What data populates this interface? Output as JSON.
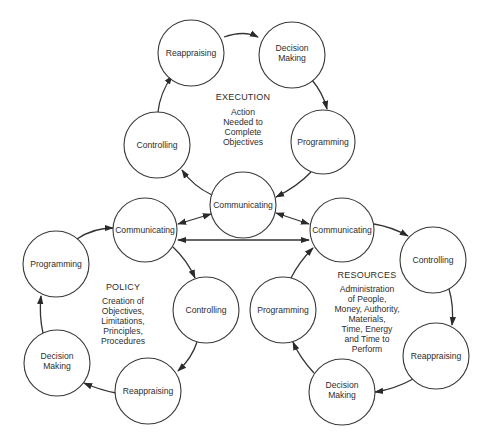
{
  "diagram": {
    "type": "cycle-network",
    "clusters": [
      {
        "id": "execution",
        "title": "EXECUTION",
        "description": [
          "Action",
          "Needed to",
          "Complete",
          "Objectives"
        ],
        "nodes": [
          {
            "id": "ex-reappraising",
            "label": [
              "Reappraising"
            ]
          },
          {
            "id": "ex-decision",
            "label": [
              "Decision",
              "Making"
            ]
          },
          {
            "id": "ex-programming",
            "label": [
              "Programming"
            ]
          },
          {
            "id": "center-communicating",
            "label": [
              "Communicating"
            ]
          },
          {
            "id": "ex-controlling",
            "label": [
              "Controlling"
            ]
          }
        ]
      },
      {
        "id": "policy",
        "title": "POLICY",
        "description": [
          "Creation of",
          "Objectives,",
          "Limitations,",
          "Principles,",
          "Procedures"
        ],
        "nodes": [
          {
            "id": "po-communicating",
            "label": [
              "Communicating"
            ]
          },
          {
            "id": "po-controlling",
            "label": [
              "Controlling"
            ]
          },
          {
            "id": "po-reappraising",
            "label": [
              "Reappraising"
            ]
          },
          {
            "id": "po-decision",
            "label": [
              "Decision",
              "Making"
            ]
          },
          {
            "id": "po-programming",
            "label": [
              "Programming"
            ]
          }
        ]
      },
      {
        "id": "resources",
        "title": "RESOURCES",
        "description": [
          "Administration",
          "of People,",
          "Money, Authority,",
          "Materials,",
          "Time, Energy",
          "and Time to",
          "Perform"
        ],
        "nodes": [
          {
            "id": "re-communicating",
            "label": [
              "Communicating"
            ]
          },
          {
            "id": "re-controlling",
            "label": [
              "Controlling"
            ]
          },
          {
            "id": "re-reappraising",
            "label": [
              "Reappraising"
            ]
          },
          {
            "id": "re-decision",
            "label": [
              "Decision",
              "Making"
            ]
          },
          {
            "id": "re-programming",
            "label": [
              "Programming"
            ]
          }
        ]
      }
    ],
    "edges": [
      {
        "from": "ex-reappraising",
        "to": "ex-decision",
        "direction": "forward"
      },
      {
        "from": "ex-decision",
        "to": "ex-programming",
        "direction": "forward"
      },
      {
        "from": "ex-programming",
        "to": "center-communicating",
        "direction": "forward"
      },
      {
        "from": "center-communicating",
        "to": "ex-controlling",
        "direction": "forward"
      },
      {
        "from": "ex-controlling",
        "to": "ex-reappraising",
        "direction": "forward"
      },
      {
        "from": "po-communicating",
        "to": "po-controlling",
        "direction": "forward"
      },
      {
        "from": "po-controlling",
        "to": "po-reappraising",
        "direction": "forward"
      },
      {
        "from": "po-reappraising",
        "to": "po-decision",
        "direction": "forward"
      },
      {
        "from": "po-decision",
        "to": "po-programming",
        "direction": "forward"
      },
      {
        "from": "po-programming",
        "to": "po-communicating",
        "direction": "forward"
      },
      {
        "from": "re-communicating",
        "to": "re-controlling",
        "direction": "forward"
      },
      {
        "from": "re-controlling",
        "to": "re-reappraising",
        "direction": "forward"
      },
      {
        "from": "re-reappraising",
        "to": "re-decision",
        "direction": "forward"
      },
      {
        "from": "re-decision",
        "to": "re-programming",
        "direction": "forward"
      },
      {
        "from": "re-programming",
        "to": "re-communicating",
        "direction": "forward"
      },
      {
        "from": "center-communicating",
        "to": "po-communicating",
        "direction": "both"
      },
      {
        "from": "center-communicating",
        "to": "re-communicating",
        "direction": "both"
      },
      {
        "from": "po-communicating",
        "to": "re-communicating",
        "direction": "both"
      }
    ]
  },
  "labels": {
    "execution_title": "EXECUTION",
    "execution_lines": [
      "Action",
      "Needed to",
      "Complete",
      "Objectives"
    ],
    "policy_title": "POLICY",
    "policy_lines": [
      "Creation of",
      "Objectives,",
      "Limitations,",
      "Principles,",
      "Procedures"
    ],
    "resources_title": "RESOURCES",
    "resources_lines": [
      "Administration",
      "of People,",
      "Money, Authority,",
      "Materials,",
      "Time, Energy",
      "and Time to",
      "Perform"
    ],
    "nodes": {
      "ex_reappraising": "Reappraising",
      "ex_decision_1": "Decision",
      "ex_decision_2": "Making",
      "ex_programming": "Programming",
      "ex_controlling": "Controlling",
      "center_communicating": "Communicating",
      "po_communicating": "Communicating",
      "po_controlling": "Controlling",
      "po_reappraising": "Reappraising",
      "po_decision_1": "Decision",
      "po_decision_2": "Making",
      "po_programming": "Programming",
      "re_communicating": "Communicating",
      "re_controlling": "Controlling",
      "re_reappraising": "Reappraising",
      "re_decision_1": "Decision",
      "re_decision_2": "Making",
      "re_programming": "Programming"
    }
  }
}
